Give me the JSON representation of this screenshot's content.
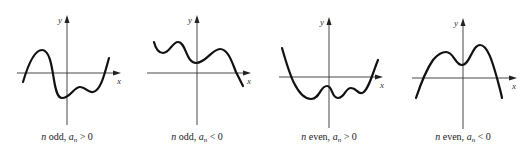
{
  "figure": {
    "panels": [
      {
        "id": "odd-positive",
        "x_label": "x",
        "y_label": "y",
        "caption": {
          "n": "n",
          "parity": " odd, ",
          "a": "a",
          "sub": "n",
          "rel": " > 0"
        },
        "description": "Odd-degree polynomial with positive leading coefficient: falls to the left, rises to the right"
      },
      {
        "id": "odd-negative",
        "x_label": "x",
        "y_label": "y",
        "caption": {
          "n": "n",
          "parity": " odd, ",
          "a": "a",
          "sub": "n",
          "rel": " < 0"
        },
        "description": "Odd-degree polynomial with negative leading coefficient: rises to the left, falls to the right"
      },
      {
        "id": "even-positive",
        "x_label": "x",
        "y_label": "y",
        "caption": {
          "n": "n",
          "parity": " even, ",
          "a": "a",
          "sub": "n",
          "rel": " > 0"
        },
        "description": "Even-degree polynomial with positive leading coefficient: rises on both ends"
      },
      {
        "id": "even-negative",
        "x_label": "x",
        "y_label": "y",
        "caption": {
          "n": "n",
          "parity": " even, ",
          "a": "a",
          "sub": "n",
          "rel": " < 0"
        },
        "description": "Even-degree polynomial with negative leading coefficient: falls on both ends"
      }
    ]
  }
}
